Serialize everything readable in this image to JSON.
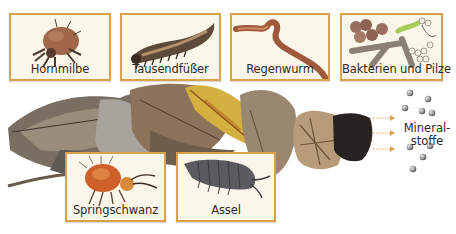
{
  "diagram": {
    "organisms_top": [
      {
        "name": "Hornmilbe",
        "icon": "mite-icon"
      },
      {
        "name": "Tausendfüßer",
        "icon": "millipede-icon"
      },
      {
        "name": "Regenwurm",
        "icon": "earthworm-icon"
      },
      {
        "name": "Bakterien und Pilze",
        "icon": "bacteria-fungi-icon"
      }
    ],
    "organisms_bottom": [
      {
        "name": "Springschwanz",
        "icon": "springtail-icon"
      },
      {
        "name": "Assel",
        "icon": "woodlouse-icon"
      }
    ],
    "process": {
      "stages": [
        "fallen leaves",
        "decomposed leaves",
        "fragmented litter",
        "humus"
      ],
      "arrows_count": 3,
      "output_label_line1": "Mineral-",
      "output_label_line2": "stoffe",
      "particles_count": 9
    },
    "colors": {
      "card_border": "#d9a24a",
      "card_background": "#fbf6ea",
      "arrow": "#e3a44a",
      "particle": "#9a9a9a",
      "text": "#2c2a27"
    }
  }
}
